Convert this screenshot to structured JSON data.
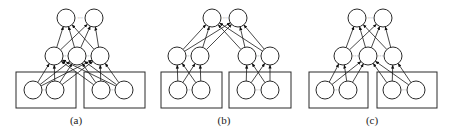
{
  "figure": {
    "panels": [
      {
        "id": "a",
        "caption": "(a)",
        "caption_pos": [
          76,
          124
        ],
        "top_nodes": [
          [
            66,
            18
          ],
          [
            94,
            18
          ]
        ],
        "mid_nodes": [
          [
            54,
            56
          ],
          [
            77,
            56
          ],
          [
            100,
            56
          ]
        ],
        "bottom_nodes": [
          [
            33,
            90
          ],
          [
            55,
            90
          ],
          [
            101,
            90
          ],
          [
            124,
            90
          ]
        ],
        "boxes": [
          [
            16,
            72,
            60,
            36
          ],
          [
            84,
            72,
            61,
            36
          ]
        ],
        "top_dots": [
          [
            80,
            18
          ]
        ],
        "mid_dots": [
          [
            65.5,
            56
          ],
          [
            88.5,
            56
          ]
        ],
        "bottom_dots": [
          [
            44,
            90
          ],
          [
            112.5,
            90
          ]
        ],
        "edges_bottom_mid": [
          [
            0,
            0
          ],
          [
            0,
            1
          ],
          [
            0,
            2
          ],
          [
            1,
            0
          ],
          [
            1,
            1
          ],
          [
            1,
            2
          ],
          [
            2,
            0
          ],
          [
            2,
            1
          ],
          [
            2,
            2
          ],
          [
            3,
            0
          ],
          [
            3,
            1
          ],
          [
            3,
            2
          ]
        ],
        "edges_mid_top": [
          [
            0,
            0
          ],
          [
            0,
            1
          ],
          [
            1,
            0
          ],
          [
            1,
            1
          ],
          [
            2,
            0
          ],
          [
            2,
            1
          ]
        ]
      },
      {
        "id": "b",
        "caption": "(b)",
        "caption_pos": [
          224,
          124
        ],
        "top_nodes": [
          [
            212,
            18
          ],
          [
            238,
            18
          ]
        ],
        "mid_nodes": [
          [
            177,
            56
          ],
          [
            200,
            56
          ],
          [
            247,
            56
          ],
          [
            270,
            56
          ]
        ],
        "bottom_nodes": [
          [
            178,
            90
          ],
          [
            201,
            90
          ],
          [
            246,
            90
          ],
          [
            270,
            90
          ]
        ],
        "boxes": [
          [
            161,
            72,
            61,
            36
          ],
          [
            229,
            72,
            62,
            36
          ]
        ],
        "top_dots": [
          [
            225,
            18
          ]
        ],
        "mid_dots": [
          [
            188.5,
            56
          ],
          [
            258.5,
            56
          ]
        ],
        "bottom_dots": [
          [
            189.5,
            90
          ],
          [
            258,
            90
          ]
        ],
        "edges_bottom_mid": [
          [
            0,
            0
          ],
          [
            0,
            1
          ],
          [
            1,
            0
          ],
          [
            1,
            1
          ],
          [
            2,
            2
          ],
          [
            2,
            3
          ],
          [
            3,
            2
          ],
          [
            3,
            3
          ]
        ],
        "edges_mid_top": [
          [
            0,
            0
          ],
          [
            0,
            1
          ],
          [
            1,
            0
          ],
          [
            1,
            1
          ],
          [
            2,
            0
          ],
          [
            2,
            1
          ],
          [
            3,
            0
          ],
          [
            3,
            1
          ]
        ]
      },
      {
        "id": "c",
        "caption": "(c)",
        "caption_pos": [
          372,
          124
        ],
        "top_nodes": [
          [
            357,
            18
          ],
          [
            383,
            18
          ]
        ],
        "mid_nodes": [
          [
            343,
            56
          ],
          [
            368,
            56
          ],
          [
            393,
            56
          ]
        ],
        "bottom_nodes": [
          [
            325,
            90
          ],
          [
            348,
            90
          ],
          [
            392,
            90
          ],
          [
            416,
            90
          ]
        ],
        "boxes": [
          [
            309,
            72,
            59,
            36
          ],
          [
            377,
            72,
            60,
            36
          ]
        ],
        "top_dots": [
          [
            370,
            18
          ]
        ],
        "mid_dots": [
          [
            355.5,
            56
          ],
          [
            380.5,
            56
          ]
        ],
        "bottom_dots": [
          [
            336.5,
            90
          ],
          [
            404,
            90
          ]
        ],
        "edges_bottom_mid": [
          [
            0,
            0
          ],
          [
            0,
            1
          ],
          [
            1,
            0
          ],
          [
            1,
            1
          ],
          [
            2,
            1
          ],
          [
            2,
            2
          ],
          [
            3,
            1
          ],
          [
            3,
            2
          ]
        ],
        "edges_mid_top": [
          [
            0,
            0
          ],
          [
            0,
            1
          ],
          [
            1,
            0
          ],
          [
            1,
            1
          ],
          [
            2,
            0
          ],
          [
            2,
            1
          ]
        ]
      }
    ],
    "node_radius": 9,
    "dots_text": "···"
  }
}
